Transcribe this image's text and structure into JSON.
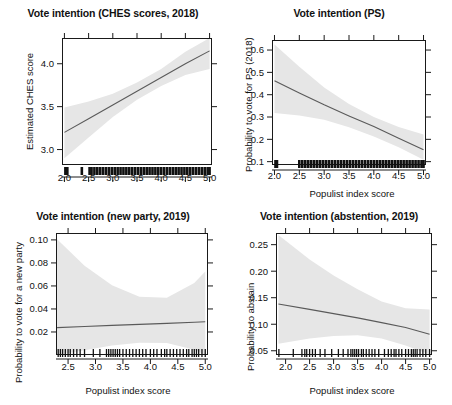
{
  "figure": {
    "background": "#ffffff",
    "band_color": "#e6e6e6",
    "line_color": "#5a5a5a",
    "axis_color": "#1a1a1a"
  },
  "chart_data": [
    {
      "type": "line",
      "panel": "top-left",
      "title": "Vote intention (CHES scores, 2018)",
      "xlabel": "",
      "ylabel": "Estimated CHES score",
      "xlim": [
        1.95,
        5.05
      ],
      "ylim": [
        2.82,
        4.3
      ],
      "xticks": [
        2.0,
        2.5,
        3.0,
        3.5,
        4.0,
        4.5,
        5.0
      ],
      "xticklabels": [
        "2.0",
        "2.5",
        "3.0",
        "3.5",
        "4.0",
        "4.5",
        "5.0"
      ],
      "yticks": [
        3.0,
        3.5,
        4.0
      ],
      "yticklabels": [
        "3.0",
        "3.5",
        "4.0"
      ],
      "grid": false,
      "legend": "none",
      "series": [
        {
          "name": "fit",
          "x": [
            2.0,
            2.5,
            3.0,
            3.5,
            4.0,
            4.5,
            5.0
          ],
          "values": [
            3.2,
            3.36,
            3.52,
            3.68,
            3.84,
            4.0,
            4.15
          ]
        },
        {
          "name": "ci_upper",
          "x": [
            2.0,
            2.5,
            3.0,
            3.5,
            4.0,
            4.5,
            5.0
          ],
          "values": [
            3.49,
            3.56,
            3.65,
            3.78,
            3.94,
            4.14,
            4.38
          ]
        },
        {
          "name": "ci_lower",
          "x": [
            2.0,
            2.5,
            3.0,
            3.5,
            4.0,
            4.5,
            5.0
          ],
          "values": [
            2.9,
            3.14,
            3.38,
            3.58,
            3.74,
            3.87,
            3.94
          ]
        }
      ],
      "rug": [
        2.02,
        2.04,
        2.06,
        2.36,
        2.52,
        2.56,
        2.62,
        2.68,
        2.74,
        2.8,
        2.86,
        2.92,
        2.98,
        3.04,
        3.1,
        3.16,
        3.22,
        3.28,
        3.34,
        3.4,
        3.46,
        3.52,
        3.58,
        3.64,
        3.7,
        3.76,
        3.82,
        3.88,
        3.94,
        4.0,
        4.06,
        4.12,
        4.18,
        4.24,
        4.3,
        4.36,
        4.42,
        4.48,
        4.54,
        4.6,
        4.66,
        4.72,
        4.78,
        4.84,
        4.9,
        4.96,
        5.0
      ]
    },
    {
      "type": "line",
      "panel": "top-right",
      "title": "Vote intention (PS)",
      "xlabel": "Populist index score",
      "ylabel": "Probability to vote for PS (2018)",
      "xlim": [
        1.95,
        5.05
      ],
      "ylim": [
        0.085,
        0.645
      ],
      "xticks": [
        2.0,
        2.5,
        3.0,
        3.5,
        4.0,
        4.5,
        5.0
      ],
      "xticklabels": [
        "2.0",
        "2.5",
        "3.0",
        "3.5",
        "4.0",
        "4.5",
        "5.0"
      ],
      "yticks": [
        0.1,
        0.2,
        0.3,
        0.4,
        0.5,
        0.6
      ],
      "yticklabels": [
        "0.1",
        "0.2",
        "0.3",
        "0.4",
        "0.5",
        "0.6"
      ],
      "grid": false,
      "legend": "none",
      "series": [
        {
          "name": "fit",
          "x": [
            2.0,
            2.5,
            3.0,
            3.5,
            4.0,
            4.5,
            5.0
          ],
          "values": [
            0.462,
            0.408,
            0.355,
            0.305,
            0.257,
            0.205,
            0.153
          ]
        },
        {
          "name": "ci_upper",
          "x": [
            2.0,
            2.5,
            3.0,
            3.5,
            4.0,
            4.5,
            5.0
          ],
          "values": [
            0.625,
            0.525,
            0.432,
            0.358,
            0.3,
            0.255,
            0.222
          ]
        },
        {
          "name": "ci_lower",
          "x": [
            2.0,
            2.5,
            3.0,
            3.5,
            4.0,
            4.5,
            5.0
          ],
          "values": [
            0.318,
            0.307,
            0.288,
            0.254,
            0.213,
            0.165,
            0.108
          ]
        }
      ],
      "rug": [
        2.02,
        2.05,
        2.5,
        2.56,
        2.62,
        2.68,
        2.74,
        2.8,
        2.86,
        2.92,
        2.98,
        3.04,
        3.1,
        3.16,
        3.22,
        3.28,
        3.34,
        3.4,
        3.46,
        3.52,
        3.58,
        3.64,
        3.7,
        3.76,
        3.82,
        3.88,
        3.94,
        4.0,
        4.06,
        4.12,
        4.18,
        4.24,
        4.3,
        4.36,
        4.42,
        4.48,
        4.54,
        4.6,
        4.66,
        4.72,
        4.78,
        4.84,
        4.9,
        4.96,
        5.0
      ]
    },
    {
      "type": "line",
      "panel": "bottom-left",
      "title": "Vote intention (new party, 2019)",
      "xlabel": "Populist index score",
      "ylabel": "Probability to vote for a new party",
      "xlim": [
        2.28,
        5.05
      ],
      "ylim": [
        0.0,
        0.106
      ],
      "xticks": [
        2.5,
        3.0,
        3.5,
        4.0,
        4.5,
        5.0
      ],
      "xticklabels": [
        "2.5",
        "3.0",
        "3.5",
        "4.0",
        "4.5",
        "5.0"
      ],
      "yticks": [
        0.02,
        0.04,
        0.06,
        0.08,
        0.1
      ],
      "yticklabels": [
        "0.02",
        "0.04",
        "0.06",
        "0.08",
        "0.10"
      ],
      "grid": false,
      "legend": "none",
      "series": [
        {
          "name": "fit",
          "x": [
            2.3,
            2.8,
            3.3,
            3.8,
            4.3,
            4.8,
            5.0
          ],
          "values": [
            0.0238,
            0.0248,
            0.0257,
            0.0266,
            0.0275,
            0.0285,
            0.0289
          ]
        },
        {
          "name": "ci_upper",
          "x": [
            2.3,
            2.8,
            3.3,
            3.8,
            4.3,
            4.8,
            5.0
          ],
          "values": [
            0.1005,
            0.0775,
            0.0605,
            0.0506,
            0.0497,
            0.0625,
            0.0725
          ]
        },
        {
          "name": "ci_lower",
          "x": [
            2.3,
            2.8,
            3.3,
            3.8,
            4.3,
            4.8,
            5.0
          ],
          "values": [
            0.0,
            0.0042,
            0.0082,
            0.0106,
            0.0105,
            0.0045,
            0.0
          ]
        }
      ],
      "rug": [
        2.32,
        2.36,
        2.4,
        2.45,
        2.5,
        2.54,
        2.6,
        2.66,
        2.72,
        2.8,
        2.96,
        3.08,
        3.2,
        3.24,
        3.28,
        3.32,
        3.36,
        3.4,
        3.44,
        3.5,
        3.56,
        3.62,
        3.68,
        3.74,
        3.8,
        3.86,
        3.92,
        4.0,
        4.06,
        4.12,
        4.2,
        4.26,
        4.3,
        4.36,
        4.42,
        4.48,
        4.54,
        4.6,
        4.66,
        4.7,
        4.76,
        4.8,
        4.84,
        4.88,
        4.94,
        5.0
      ]
    },
    {
      "type": "line",
      "panel": "bottom-right",
      "title": "Vote intention (abstention, 2019)",
      "xlabel": "Populist index score",
      "ylabel": "Probability to abstain",
      "xlim": [
        1.8,
        5.05
      ],
      "ylim": [
        0.042,
        0.272
      ],
      "xticks": [
        2.0,
        2.5,
        3.0,
        3.5,
        4.0,
        4.5,
        5.0
      ],
      "xticklabels": [
        "2.0",
        "2.5",
        "3.0",
        "3.5",
        "4.0",
        "4.5",
        "5.0"
      ],
      "yticks": [
        0.05,
        0.1,
        0.15,
        0.2,
        0.25
      ],
      "yticklabels": [
        "0.05",
        "0.10",
        "0.15",
        "0.20",
        "0.25"
      ],
      "grid": false,
      "legend": "none",
      "series": [
        {
          "name": "fit",
          "x": [
            1.85,
            2.5,
            3.0,
            3.5,
            4.0,
            4.5,
            5.0
          ],
          "values": [
            0.138,
            0.128,
            0.12,
            0.112,
            0.103,
            0.094,
            0.081
          ]
        },
        {
          "name": "ci_upper",
          "x": [
            1.85,
            2.5,
            3.0,
            3.5,
            4.0,
            4.5,
            5.0
          ],
          "values": [
            0.268,
            0.222,
            0.192,
            0.166,
            0.143,
            0.13,
            0.128
          ]
        },
        {
          "name": "ci_lower",
          "x": [
            1.85,
            2.5,
            3.0,
            3.5,
            4.0,
            4.5,
            5.0
          ],
          "values": [
            0.063,
            0.073,
            0.078,
            0.079,
            0.073,
            0.06,
            0.043
          ]
        }
      ],
      "rug": [
        1.86,
        2.16,
        2.34,
        2.4,
        2.44,
        2.5,
        2.56,
        2.62,
        2.72,
        2.82,
        2.96,
        3.1,
        3.2,
        3.3,
        3.36,
        3.4,
        3.44,
        3.48,
        3.52,
        3.58,
        3.62,
        3.68,
        3.74,
        3.8,
        3.86,
        3.94,
        4.06,
        4.14,
        4.2,
        4.26,
        4.3,
        4.36,
        4.42,
        4.5,
        4.56,
        4.62,
        4.66,
        4.7,
        4.74,
        4.8,
        4.86,
        4.92,
        5.0
      ]
    }
  ]
}
